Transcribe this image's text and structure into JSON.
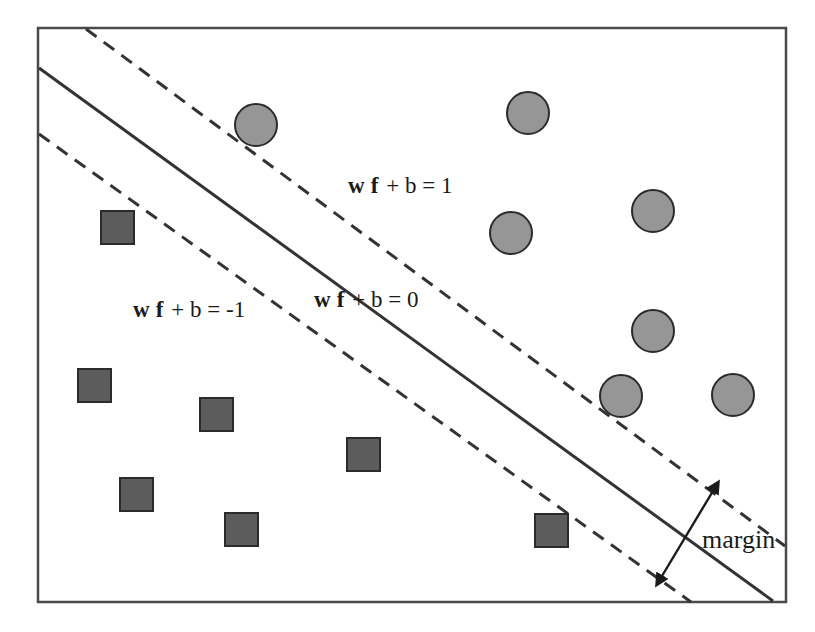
{
  "figure": {
    "frame": {
      "x": 38,
      "y": 28,
      "width": 748,
      "height": 574,
      "stroke": "#4a4a4a",
      "stroke_width": 2.5,
      "fill": "#ffffff"
    }
  },
  "labels": {
    "upper_boundary": {
      "prefix_bold_1": "w",
      "prefix_bold_2": "f",
      "rest": "+ b = 1",
      "text": "w f + b = 1",
      "x": 348,
      "y": 193
    },
    "decision_boundary": {
      "prefix_bold_1": "w",
      "prefix_bold_2": "f",
      "rest": "+ b = 0",
      "text": "w f + b = 0",
      "x": 314,
      "y": 307
    },
    "lower_boundary": {
      "prefix_bold_1": "w",
      "prefix_bold_2": "f",
      "rest": "+ b = -1",
      "text": "w f + b = -1",
      "x": 133,
      "y": 317
    },
    "margin": {
      "text": "margin",
      "x": 702,
      "y": 548
    }
  },
  "lines": {
    "decision_boundary": {
      "name": "w f + b = 0",
      "style": "solid",
      "x1": 39,
      "y1": 68,
      "x2": 773,
      "y2": 601,
      "stroke": "#333333",
      "stroke_width": 3
    },
    "upper_margin_boundary": {
      "name": "w f + b = 1",
      "style": "dashed",
      "x1": 86,
      "y1": 29,
      "x2": 785,
      "y2": 546,
      "stroke": "#333333",
      "stroke_width": 3,
      "dash": "13 9"
    },
    "lower_margin_boundary": {
      "name": "w f + b = -1",
      "style": "dashed",
      "x1": 39,
      "y1": 134,
      "x2": 691,
      "y2": 602,
      "stroke": "#333333",
      "stroke_width": 3,
      "dash": "13 9"
    }
  },
  "margin_arrow": {
    "x1": 713,
    "y1": 491,
    "x2": 662,
    "y2": 576,
    "stroke": "#1a1a1a",
    "stroke_width": 2.4,
    "double_headed": true
  },
  "style": {
    "circle_fill": "#969696",
    "circle_stroke": "#2b2b2b",
    "circle_stroke_width": 2,
    "circle_radius": 21,
    "square_fill": "#5c5c5c",
    "square_stroke": "#2b2b2b",
    "square_stroke_width": 2,
    "square_size": 33
  },
  "data_points": {
    "class_positive_label": "circle",
    "class_negative_label": "square",
    "circles": [
      {
        "cx": 256,
        "cy": 125
      },
      {
        "cx": 528,
        "cy": 113
      },
      {
        "cx": 511,
        "cy": 233
      },
      {
        "cx": 653,
        "cy": 211
      },
      {
        "cx": 653,
        "cy": 331
      },
      {
        "cx": 621,
        "cy": 396
      },
      {
        "cx": 733,
        "cy": 395
      }
    ],
    "squares": [
      {
        "x": 101,
        "y": 211
      },
      {
        "x": 78,
        "y": 369
      },
      {
        "x": 200,
        "y": 398
      },
      {
        "x": 347,
        "y": 438
      },
      {
        "x": 120,
        "y": 478
      },
      {
        "x": 225,
        "y": 513
      },
      {
        "x": 535,
        "y": 514
      }
    ]
  }
}
